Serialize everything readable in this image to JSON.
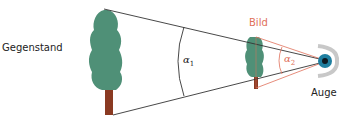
{
  "labels": {
    "object": "Gegenstand",
    "image": "Bild",
    "eye": "Auge",
    "alpha1": "α",
    "alpha1_sub": "1",
    "alpha2": "α",
    "alpha2_sub": "2"
  },
  "colors": {
    "foliage": "#4f9077",
    "trunk": "#8a3a22",
    "lines": "#333333",
    "image_lines": "#e0705a",
    "image_label": "#e0705a",
    "eye_iris": "#1f7fa0"
  }
}
